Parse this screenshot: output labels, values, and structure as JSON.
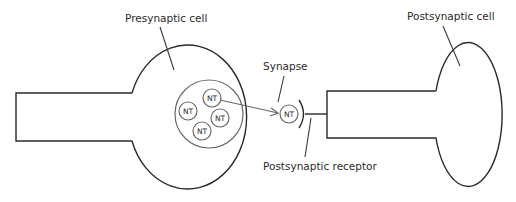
{
  "diagram": {
    "labels": {
      "presynaptic_cell": "Presynaptic cell",
      "postsynaptic_cell": "Postsynaptic cell",
      "synapse": "Synapse",
      "postsynaptic_receptor": "Postsynaptic receptor"
    },
    "vesicle_contents": [
      "NT",
      "NT",
      "NT",
      "NT"
    ],
    "released_neurotransmitter": "NT",
    "colors": {
      "line": "#2a2a2a",
      "vesicle": "#6a6a6a",
      "background": "#ffffff"
    }
  }
}
